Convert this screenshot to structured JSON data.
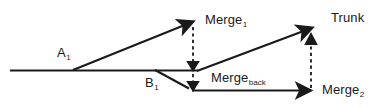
{
  "diagram": {
    "background_color": "#ffffff",
    "line_color": "#1a1a1a",
    "text_color": "#1a1a1a",
    "labels": {
      "a1": {
        "base": "A",
        "sub": "1"
      },
      "b1": {
        "base": "B",
        "sub": "1"
      },
      "merge1": {
        "base": "Merge",
        "sub": "1"
      },
      "trunk": {
        "base": "Trunk",
        "sub": ""
      },
      "merge_back": {
        "base": "Merge",
        "sub": "back"
      },
      "merge2": {
        "base": "Merge",
        "sub": "2"
      }
    },
    "edges": [
      {
        "name": "trunk-baseline",
        "style": "solid",
        "from": [
          10,
          70
        ],
        "to": [
          197,
          70
        ]
      },
      {
        "name": "branch-a1-to-merge1",
        "style": "solid",
        "from": [
          73,
          70
        ],
        "to": [
          188,
          24
        ]
      },
      {
        "name": "branch-b1-to-mergeback",
        "style": "solid",
        "from": [
          155,
          70
        ],
        "to": [
          190,
          89
        ]
      },
      {
        "name": "mergeback-to-merge2",
        "style": "solid",
        "from": [
          195,
          90
        ],
        "to": [
          305,
          90
        ]
      },
      {
        "name": "mergeback-to-trunk",
        "style": "solid",
        "from": [
          197,
          71
        ],
        "to": [
          307,
          30
        ]
      },
      {
        "name": "merge1-down-to-trunk",
        "style": "dashed",
        "from": [
          193,
          28
        ],
        "to": [
          193,
          64
        ]
      },
      {
        "name": "trunk-down-to-mergeback",
        "style": "dashed",
        "from": [
          193,
          74
        ],
        "to": [
          193,
          84
        ]
      },
      {
        "name": "merge2-up-to-trunk",
        "style": "dashed",
        "from": [
          311,
          86
        ],
        "to": [
          311,
          40
        ]
      }
    ]
  }
}
